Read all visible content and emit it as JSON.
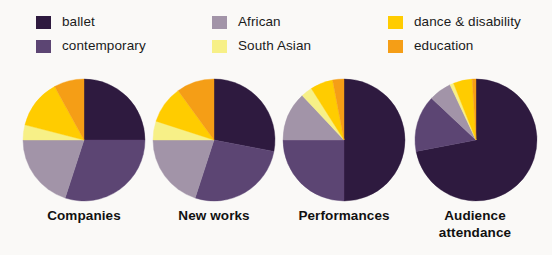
{
  "legend": {
    "columns": [
      {
        "items": [
          {
            "label": "ballet",
            "color": "#2e1a3f",
            "key": "ballet"
          },
          {
            "label": "contemporary",
            "color": "#5c4573",
            "key": "contemporary"
          }
        ]
      },
      {
        "items": [
          {
            "label": "African",
            "color": "#a294a8",
            "key": "african"
          },
          {
            "label": "South Asian",
            "color": "#f7f087",
            "key": "south-asian"
          }
        ]
      },
      {
        "items": [
          {
            "label": "dance & disability",
            "color": "#ffcc00",
            "key": "dance-disability"
          },
          {
            "label": "education",
            "color": "#f59e16",
            "key": "education"
          }
        ]
      }
    ]
  },
  "captions": [
    {
      "line1": "Companies",
      "line2": ""
    },
    {
      "line1": "New works",
      "line2": ""
    },
    {
      "line1": "Performances",
      "line2": ""
    },
    {
      "line1": "Audience",
      "line2": "attendance"
    }
  ],
  "chart_data": {
    "type": "pie",
    "title": "",
    "subtitle": "",
    "xlabel": "",
    "ylabel": "",
    "legend_position": "top",
    "grid": false,
    "units": "percent",
    "start_angle_deg": 0,
    "direction": "clockwise",
    "categories": [
      "ballet",
      "contemporary",
      "African",
      "South Asian",
      "dance & disability",
      "education"
    ],
    "colors": [
      "#2e1a3f",
      "#5c4573",
      "#a294a8",
      "#f7f087",
      "#ffcc00",
      "#f59e16"
    ],
    "charts": [
      {
        "name": "Companies",
        "label_line1": "Companies",
        "label_line2": "",
        "values": [
          25,
          30,
          20,
          4,
          13,
          8
        ]
      },
      {
        "name": "New works",
        "label_line1": "New works",
        "label_line2": "",
        "values": [
          28,
          27,
          20,
          5,
          10,
          10
        ]
      },
      {
        "name": "Performances",
        "label_line1": "Performances",
        "label_line2": "",
        "values": [
          50,
          25,
          13,
          3,
          6,
          3
        ]
      },
      {
        "name": "Audience attendance",
        "label_line1": "Audience",
        "label_line2": "attendance",
        "values": [
          72,
          15,
          6,
          1,
          5,
          1
        ]
      }
    ]
  },
  "style": {
    "background": "#faf9f7",
    "text_color": "#1b1b1b",
    "caption_color": "#111111"
  }
}
